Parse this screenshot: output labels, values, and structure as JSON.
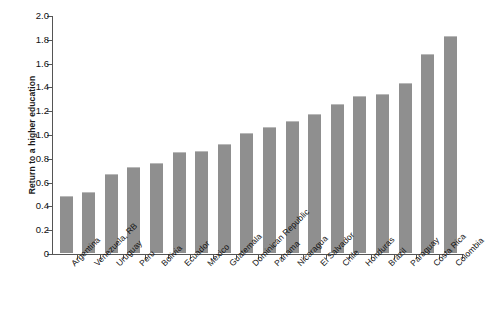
{
  "chart_data": {
    "type": "bar",
    "title": "",
    "xlabel": "",
    "ylabel": "Return to a higher education",
    "ylim": [
      0,
      2.0
    ],
    "y_ticks": [
      "0",
      "0.2",
      "0.4",
      "0.6",
      "0.8",
      "1.0",
      "1.2",
      "1.4",
      "1.6",
      "1.8",
      "2.0"
    ],
    "y_tick_values": [
      0,
      0.2,
      0.4,
      0.6,
      0.8,
      1.0,
      1.2,
      1.4,
      1.6,
      1.8,
      2.0
    ],
    "grid": false,
    "legend": null,
    "bar_color": "#8f8f8f",
    "axis_color": "#555555",
    "categories": [
      "Argentina",
      "Venezuela, RB",
      "Uruguay",
      "Peru",
      "Bolivia",
      "Ecuador",
      "Mexico",
      "Guatemala",
      "Dominican Republic",
      "Panama",
      "Nicaragua",
      "El Salvador",
      "Chile",
      "Honduras",
      "Brazil",
      "Paraguay",
      "Costa Rica",
      "Colombia"
    ],
    "values": [
      0.48,
      0.51,
      0.66,
      0.72,
      0.76,
      0.85,
      0.86,
      0.92,
      1.01,
      1.06,
      1.11,
      1.17,
      1.25,
      1.32,
      1.34,
      1.43,
      1.67,
      1.82
    ]
  }
}
